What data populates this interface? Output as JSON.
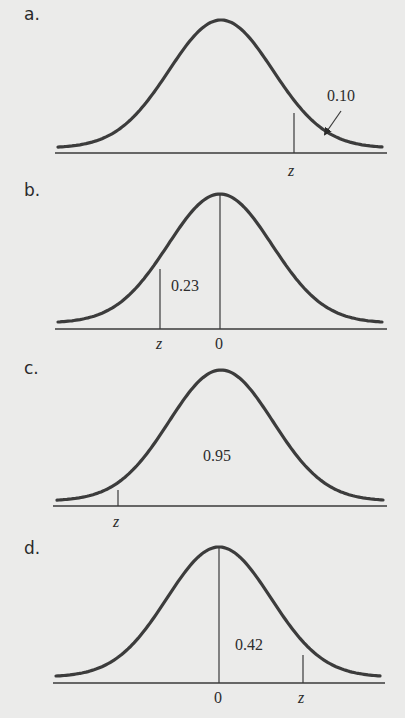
{
  "figure": {
    "panels": [
      {
        "letter": "a.",
        "area_label": "0.10",
        "z_label": "z",
        "zero_label": ""
      },
      {
        "letter": "b.",
        "area_label": "0.23",
        "z_label": "z",
        "zero_label": "0"
      },
      {
        "letter": "c.",
        "area_label": "0.95",
        "z_label": "z",
        "zero_label": ""
      },
      {
        "letter": "d.",
        "area_label": "0.42",
        "z_label": "z",
        "zero_label": "0"
      }
    ]
  },
  "chart_data": [
    {
      "type": "area",
      "title": "a.",
      "distribution": "standard normal",
      "shaded_region": "right tail beyond z",
      "area": 0.1,
      "labels": [
        "z",
        "0.10"
      ],
      "annotation": "arrow pointing to right tail area"
    },
    {
      "type": "area",
      "title": "b.",
      "distribution": "standard normal",
      "shaded_region": "between z and 0",
      "area": 0.23,
      "labels": [
        "z",
        "0",
        "0.23"
      ]
    },
    {
      "type": "area",
      "title": "c.",
      "distribution": "standard normal",
      "shaded_region": "right of z",
      "area": 0.95,
      "labels": [
        "z",
        "0.95"
      ]
    },
    {
      "type": "area",
      "title": "d.",
      "distribution": "standard normal",
      "shaded_region": "between 0 and z",
      "area": 0.42,
      "labels": [
        "0",
        "z",
        "0.42"
      ]
    }
  ]
}
